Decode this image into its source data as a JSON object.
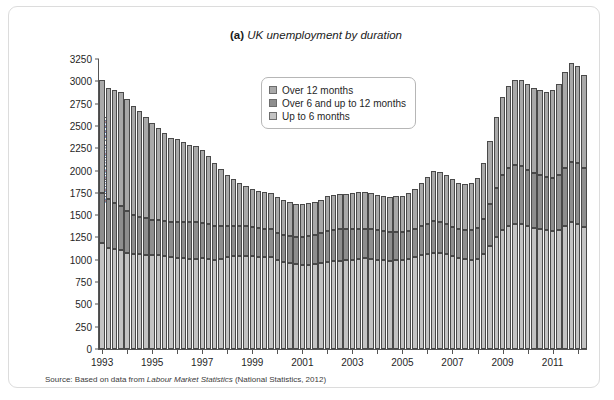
{
  "figure": {
    "prefix": "(a)",
    "title": "UK unemployment by duration",
    "source_prefix": "Source: Based on data from",
    "source_italic": "Labour Market Statistics",
    "source_suffix": "(National Statistics, 2012)"
  },
  "legend": {
    "position": "inside-top-center",
    "items": [
      {
        "label": "Over 12 months",
        "color": "#a9a9a9",
        "key": "over_12_months"
      },
      {
        "label": "Over 6 and up to 12 months",
        "color": "#8e8e8e",
        "key": "over_6_up_to_12_months"
      },
      {
        "label": "Up to 6 months",
        "color": "#c3c3c3",
        "key": "up_to_6_months"
      }
    ]
  },
  "chart_data": {
    "type": "bar",
    "stacked": true,
    "title": "(a) UK unemployment by duration",
    "xlabel": "",
    "ylabel": "Unemployment (000s)",
    "ylim": [
      0,
      3250
    ],
    "ytick_step": 250,
    "yticks": [
      0,
      250,
      500,
      750,
      1000,
      1250,
      1500,
      1750,
      2000,
      2250,
      2500,
      2750,
      3000,
      3250
    ],
    "grid": false,
    "xtick_labels": [
      "1993",
      "1995",
      "1997",
      "1999",
      "2001",
      "2003",
      "2005",
      "2007",
      "2009",
      "2011"
    ],
    "x_frequency": "quarterly",
    "x_start": "1993 Q1",
    "x_end": "2012 Q2",
    "x": [
      "1993Q1",
      "1993Q2",
      "1993Q3",
      "1993Q4",
      "1994Q1",
      "1994Q2",
      "1994Q3",
      "1994Q4",
      "1995Q1",
      "1995Q2",
      "1995Q3",
      "1995Q4",
      "1996Q1",
      "1996Q2",
      "1996Q3",
      "1996Q4",
      "1997Q1",
      "1997Q2",
      "1997Q3",
      "1997Q4",
      "1998Q1",
      "1998Q2",
      "1998Q3",
      "1998Q4",
      "1999Q1",
      "1999Q2",
      "1999Q3",
      "1999Q4",
      "2000Q1",
      "2000Q2",
      "2000Q3",
      "2000Q4",
      "2001Q1",
      "2001Q2",
      "2001Q3",
      "2001Q4",
      "2002Q1",
      "2002Q2",
      "2002Q3",
      "2002Q4",
      "2003Q1",
      "2003Q2",
      "2003Q3",
      "2003Q4",
      "2004Q1",
      "2004Q2",
      "2004Q3",
      "2004Q4",
      "2005Q1",
      "2005Q2",
      "2005Q3",
      "2005Q4",
      "2006Q1",
      "2006Q2",
      "2006Q3",
      "2006Q4",
      "2007Q1",
      "2007Q2",
      "2007Q3",
      "2007Q4",
      "2008Q1",
      "2008Q2",
      "2008Q3",
      "2008Q4",
      "2009Q1",
      "2009Q2",
      "2009Q3",
      "2009Q4",
      "2010Q1",
      "2010Q2",
      "2010Q3",
      "2010Q4",
      "2011Q1",
      "2011Q2",
      "2011Q3",
      "2011Q4",
      "2012Q1",
      "2012Q2"
    ],
    "series": [
      {
        "name": "Up to 6 months",
        "key": "up_to_6_months",
        "color": "#c3c3c3",
        "values": [
          1190,
          1130,
          1120,
          1105,
          1080,
          1065,
          1060,
          1055,
          1050,
          1050,
          1040,
          1035,
          1020,
          1015,
          1005,
          1010,
          1015,
          1010,
          1000,
          1010,
          1030,
          1040,
          1045,
          1045,
          1040,
          1035,
          1030,
          1030,
          1000,
          980,
          960,
          950,
          940,
          945,
          950,
          960,
          980,
          985,
          990,
          995,
          1000,
          1010,
          1015,
          1010,
          1000,
          995,
          990,
          995,
          1000,
          1010,
          1030,
          1050,
          1060,
          1080,
          1075,
          1060,
          1040,
          1020,
          1005,
          1000,
          1010,
          1060,
          1150,
          1250,
          1330,
          1380,
          1400,
          1400,
          1380,
          1360,
          1345,
          1330,
          1320,
          1330,
          1380,
          1420,
          1400,
          1365
        ]
      },
      {
        "name": "Over 6 and up to 12 months",
        "key": "over_6_up_to_12_months",
        "color": "#8e8e8e",
        "values": [
          560,
          555,
          520,
          500,
          470,
          440,
          425,
          415,
          400,
          395,
          390,
          385,
          400,
          405,
          415,
          410,
          400,
          390,
          380,
          365,
          350,
          340,
          335,
          330,
          325,
          320,
          315,
          310,
          300,
          300,
          305,
          310,
          320,
          325,
          330,
          335,
          345,
          350,
          350,
          345,
          340,
          335,
          330,
          330,
          330,
          325,
          320,
          315,
          310,
          310,
          315,
          325,
          345,
          355,
          350,
          340,
          330,
          325,
          325,
          330,
          350,
          400,
          480,
          560,
          620,
          650,
          660,
          650,
          630,
          615,
          605,
          600,
          600,
          615,
          650,
          680,
          680,
          660
        ]
      },
      {
        "name": "Over 12 months",
        "key": "over_12_months",
        "color": "#a9a9a9",
        "values": [
          1260,
          1245,
          1265,
          1280,
          1250,
          1220,
          1180,
          1130,
          1080,
          1030,
          990,
          950,
          930,
          900,
          870,
          850,
          820,
          760,
          700,
          640,
          570,
          520,
          480,
          450,
          430,
          420,
          410,
          405,
          400,
          390,
          380,
          370,
          365,
          365,
          370,
          375,
          385,
          390,
          395,
          400,
          405,
          410,
          410,
          405,
          400,
          395,
          395,
          400,
          410,
          425,
          450,
          480,
          520,
          555,
          560,
          545,
          530,
          520,
          520,
          530,
          560,
          620,
          700,
          790,
          870,
          920,
          950,
          960,
          955,
          950,
          950,
          955,
          980,
          1020,
          1070,
          1100,
          1090,
          1050
        ]
      }
    ]
  }
}
